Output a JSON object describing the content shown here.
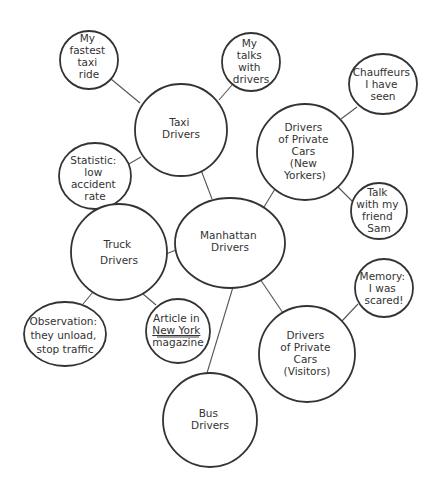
{
  "diagram": {
    "type": "cluster-map",
    "center": {
      "id": "manhattan",
      "lines": [
        "Manhattan",
        "Drivers"
      ]
    },
    "nodes": [
      {
        "id": "taxi",
        "lines": [
          "Taxi",
          "Drivers"
        ]
      },
      {
        "id": "fastest",
        "lines": [
          "My",
          "fastest",
          "taxi",
          "ride"
        ]
      },
      {
        "id": "talks",
        "lines": [
          "My",
          "talks",
          "with",
          "drivers"
        ]
      },
      {
        "id": "statistic",
        "lines": [
          "Statistic:",
          "low",
          "accident",
          "rate"
        ]
      },
      {
        "id": "private-ny",
        "lines": [
          "Drivers",
          "of Private",
          "Cars",
          "(New",
          "Yorkers)"
        ]
      },
      {
        "id": "chauffeurs",
        "lines": [
          "Chauffeurs",
          "I have",
          "seen"
        ]
      },
      {
        "id": "sam",
        "lines": [
          "Talk",
          "with my",
          "friend",
          "Sam"
        ]
      },
      {
        "id": "truck",
        "lines": [
          "Truck",
          "Drivers"
        ]
      },
      {
        "id": "observation",
        "lines": [
          "Observation:",
          "they unload,",
          "stop traffic"
        ]
      },
      {
        "id": "article",
        "lines": [
          "Article in",
          "New York",
          "magazine"
        ],
        "underlined_line": 1
      },
      {
        "id": "private-visitors",
        "lines": [
          "Drivers",
          "of Private",
          "Cars",
          "(Visitors)"
        ]
      },
      {
        "id": "memory",
        "lines": [
          "Memory:",
          "I was",
          "scared!"
        ]
      },
      {
        "id": "bus",
        "lines": [
          "Bus",
          "Drivers"
        ]
      }
    ],
    "edges": [
      [
        "manhattan",
        "taxi"
      ],
      [
        "manhattan",
        "private-ny"
      ],
      [
        "manhattan",
        "truck"
      ],
      [
        "manhattan",
        "private-visitors"
      ],
      [
        "manhattan",
        "bus"
      ],
      [
        "taxi",
        "fastest"
      ],
      [
        "taxi",
        "talks"
      ],
      [
        "taxi",
        "statistic"
      ],
      [
        "private-ny",
        "chauffeurs"
      ],
      [
        "private-ny",
        "sam"
      ],
      [
        "truck",
        "observation"
      ],
      [
        "truck",
        "article"
      ],
      [
        "private-visitors",
        "memory"
      ]
    ],
    "colors": {
      "stroke": "#333333",
      "edge": "#555555",
      "text": "#333333",
      "background": "#ffffff"
    }
  }
}
